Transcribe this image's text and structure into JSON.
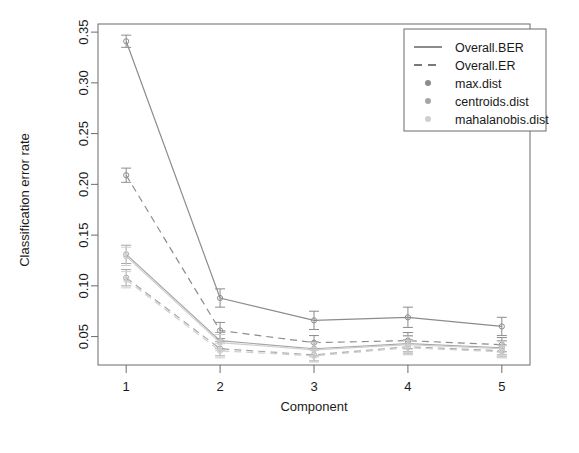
{
  "chart_data": {
    "type": "line",
    "title": "",
    "xlabel": "Component",
    "ylabel": "Classification error rate",
    "x": [
      1,
      2,
      3,
      4,
      5
    ],
    "xtick_labels": [
      "1",
      "2",
      "3",
      "4",
      "5"
    ],
    "ytick_labels": [
      "0.05",
      "0.10",
      "0.15",
      "0.20",
      "0.25",
      "0.30",
      "0.35"
    ],
    "ytick_values": [
      0.05,
      0.1,
      0.15,
      0.2,
      0.25,
      0.3,
      0.35
    ],
    "xlim": [
      0.7,
      5.3
    ],
    "ylim": [
      0.022,
      0.358
    ],
    "grid": false,
    "errorbars": true,
    "legend_position": "top-right",
    "legend_title": "",
    "legend_entries": [
      {
        "label": "Overall.BER",
        "style": "solid-line",
        "color": "#4d4d4d"
      },
      {
        "label": "Overall.ER",
        "style": "dashed-line",
        "color": "#4d4d4d"
      },
      {
        "label": "max.dist",
        "style": "dot",
        "color": "#8c8c8c"
      },
      {
        "label": "centroids.dist",
        "style": "dot",
        "color": "#a6a6a6"
      },
      {
        "label": "mahalanobis.dist",
        "style": "dot",
        "color": "#cfcfcf"
      }
    ],
    "series": [
      {
        "name": "max.dist Overall.BER",
        "dist": "max.dist",
        "measure": "Overall.BER",
        "style": "solid",
        "color": "#8c8c8c",
        "values": [
          0.341,
          0.088,
          0.066,
          0.069,
          0.06
        ],
        "err": [
          0.006,
          0.009,
          0.009,
          0.01,
          0.009
        ]
      },
      {
        "name": "max.dist Overall.ER",
        "dist": "max.dist",
        "measure": "Overall.ER",
        "style": "dashed",
        "color": "#8c8c8c",
        "values": [
          0.209,
          0.056,
          0.044,
          0.046,
          0.042
        ],
        "err": [
          0.007,
          0.008,
          0.007,
          0.008,
          0.007
        ]
      },
      {
        "name": "centroids.dist Overall.BER",
        "dist": "centroids.dist",
        "measure": "Overall.BER",
        "style": "solid",
        "color": "#a6a6a6",
        "values": [
          0.131,
          0.046,
          0.038,
          0.043,
          0.039
        ],
        "err": [
          0.009,
          0.008,
          0.007,
          0.008,
          0.007
        ]
      },
      {
        "name": "centroids.dist Overall.ER",
        "dist": "centroids.dist",
        "measure": "Overall.ER",
        "style": "dashed",
        "color": "#a6a6a6",
        "values": [
          0.108,
          0.038,
          0.032,
          0.04,
          0.036
        ],
        "err": [
          0.008,
          0.007,
          0.006,
          0.007,
          0.006
        ]
      },
      {
        "name": "mahalanobis.dist Overall.BER",
        "dist": "mahalanobis.dist",
        "measure": "Overall.BER",
        "style": "solid",
        "color": "#cfcfcf",
        "values": [
          0.129,
          0.044,
          0.037,
          0.042,
          0.038
        ],
        "err": [
          0.009,
          0.008,
          0.007,
          0.008,
          0.007
        ]
      },
      {
        "name": "mahalanobis.dist Overall.ER",
        "dist": "mahalanobis.dist",
        "measure": "Overall.ER",
        "style": "dashed",
        "color": "#cfcfcf",
        "values": [
          0.106,
          0.036,
          0.031,
          0.039,
          0.035
        ],
        "err": [
          0.008,
          0.007,
          0.006,
          0.007,
          0.006
        ]
      }
    ]
  },
  "axes": {
    "frame_color": "#6b6b6b",
    "text_color": "#1a1a1a"
  }
}
